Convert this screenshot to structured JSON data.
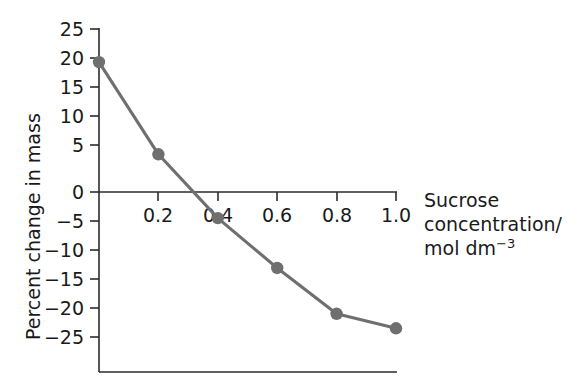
{
  "chart_data": {
    "type": "line",
    "title": "",
    "xlabel": "Sucrose concentration/ mol dm⁻³",
    "ylabel": "Percent change in mass",
    "x": [
      0.0,
      0.2,
      0.4,
      0.6,
      0.8,
      1.0
    ],
    "values": [
      22.4,
      6.5,
      -4.5,
      -13.1,
      -21.0,
      -23.5
    ],
    "series": [
      {
        "name": "Percent change in mass",
        "values": [
          22.4,
          6.5,
          -4.5,
          -13.1,
          -21.0,
          -23.5
        ]
      }
    ],
    "xlim": [
      0.0,
      1.0
    ],
    "ylim": [
      -25,
      25
    ],
    "xticks": [
      0.0,
      0.2,
      0.4,
      0.6,
      0.8,
      1.0
    ],
    "yticks": [
      25,
      20,
      15,
      10,
      5,
      0,
      -5,
      -10,
      -15,
      -20,
      -25
    ],
    "xtick_labels": [
      "",
      "0.2",
      "0.4",
      "0.6",
      "0.8",
      "1.0"
    ],
    "ytick_labels": [
      "25",
      "20",
      "15",
      "10",
      "5",
      "0",
      "−5",
      "−10",
      "−15",
      "−20",
      "−25"
    ],
    "grid": false,
    "legend": null,
    "line_color": "#6f6f6f",
    "marker_color": "#6f6f6f",
    "axis_color": "#2b2b2b"
  },
  "axis_titles": {
    "y": "Percent change in mass",
    "x_line1": "Sucrose",
    "x_line2": "concentration/",
    "x_line3_main": "mol dm",
    "x_line3_sup": "−3"
  },
  "ytick_labels": {
    "t0": "25",
    "t1": "20",
    "t2": "15",
    "t3": "10",
    "t4": "5",
    "t5": "0",
    "t6": "−5",
    "t7": "−10",
    "t8": "−15",
    "t9": "−20",
    "t10": "−25"
  },
  "xtick_labels": {
    "t1": "0.2",
    "t2": "0.4",
    "t3": "0.6",
    "t4": "0.8",
    "t5": "1.0"
  }
}
